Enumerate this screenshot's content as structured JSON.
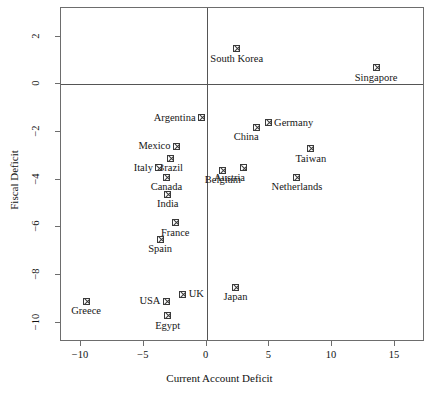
{
  "chart_data": {
    "type": "scatter",
    "title": "",
    "xlabel": "Current Account Deficit",
    "ylabel": "Fiscal Deficit",
    "xlim": [
      -11.6,
      17.4
    ],
    "ylim": [
      -10.8,
      3.2
    ],
    "xticks": [
      -10,
      -5,
      0,
      5,
      10,
      15
    ],
    "xtick_labels": [
      "−10",
      "−5",
      "0",
      "5",
      "10",
      "15"
    ],
    "yticks": [
      2,
      0,
      -2,
      -4,
      -6,
      -8,
      -10
    ],
    "ytick_labels": [
      "2",
      "0",
      "−2",
      "−4",
      "−6",
      "−8",
      "−10"
    ],
    "grid": false,
    "legend": "none",
    "reference_lines": {
      "vertical_x": 0,
      "horizontal_y": 0
    },
    "points": [
      {
        "label": "South Korea",
        "x": 2.4,
        "y": 1.5,
        "label_pos": "below"
      },
      {
        "label": "Singapore",
        "x": 13.5,
        "y": 0.7,
        "label_pos": "below"
      },
      {
        "label": "Argentina",
        "x": -0.4,
        "y": -1.4,
        "label_pos": "left"
      },
      {
        "label": "Germany",
        "x": 4.9,
        "y": -1.6,
        "label_pos": "right"
      },
      {
        "label": "China",
        "x": 4.0,
        "y": -1.8,
        "label_pos": "below-left"
      },
      {
        "label": "Mexico",
        "x": -2.4,
        "y": -2.6,
        "label_pos": "left"
      },
      {
        "label": "Taiwan",
        "x": 8.3,
        "y": -2.7,
        "label_pos": "below"
      },
      {
        "label": "Brazil",
        "x": -2.9,
        "y": -3.1,
        "label_pos": "below"
      },
      {
        "label": "Austria",
        "x": 2.9,
        "y": -3.5,
        "label_pos": "below-left"
      },
      {
        "label": "Italy",
        "x": -3.8,
        "y": -3.5,
        "label_pos": "left"
      },
      {
        "label": "Belgium",
        "x": 1.3,
        "y": -3.6,
        "label_pos": "below"
      },
      {
        "label": "Canada",
        "x": -3.2,
        "y": -3.9,
        "label_pos": "below"
      },
      {
        "label": "Netherlands",
        "x": 7.2,
        "y": -3.9,
        "label_pos": "below"
      },
      {
        "label": "India",
        "x": -3.1,
        "y": -4.6,
        "label_pos": "below"
      },
      {
        "label": "France",
        "x": -2.5,
        "y": -5.8,
        "label_pos": "below"
      },
      {
        "label": "Spain",
        "x": -3.7,
        "y": -6.5,
        "label_pos": "below"
      },
      {
        "label": "Japan",
        "x": 2.3,
        "y": -8.5,
        "label_pos": "below"
      },
      {
        "label": "UK",
        "x": -1.9,
        "y": -8.8,
        "label_pos": "right"
      },
      {
        "label": "Greece",
        "x": -9.6,
        "y": -9.1,
        "label_pos": "below"
      },
      {
        "label": "USA",
        "x": -3.2,
        "y": -9.1,
        "label_pos": "left"
      },
      {
        "label": "Egypt",
        "x": -3.1,
        "y": -9.7,
        "label_pos": "below"
      }
    ],
    "colors": {
      "frame": "#6d6d6d",
      "reference_line": "#555555",
      "marker_stroke": "#3a3a3a",
      "text": "#161616",
      "background": "#ffffff"
    }
  }
}
